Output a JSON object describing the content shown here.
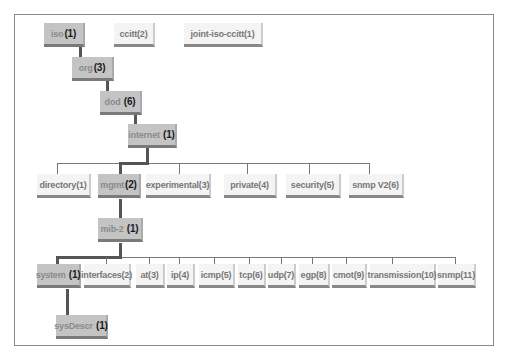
{
  "diagram": {
    "roots": [
      {
        "id": "iso",
        "name": "iso",
        "num": "(1)",
        "highlight": true
      },
      {
        "id": "ccitt",
        "name": "ccitt(2)",
        "num": "",
        "highlight": false
      },
      {
        "id": "joint",
        "name": "joint-iso-ccitt(1)",
        "num": "",
        "highlight": false
      }
    ],
    "path": [
      {
        "id": "org",
        "name": "org",
        "num": "(3)"
      },
      {
        "id": "dod",
        "name": "dod ",
        "num": "(6)"
      },
      {
        "id": "internet",
        "name": "internet ",
        "num": "(1)"
      }
    ],
    "internet_children": [
      {
        "id": "directory",
        "name": "directory(1)",
        "highlight": false
      },
      {
        "id": "mgmt",
        "name": "mgmt",
        "num": "(2)",
        "highlight": true
      },
      {
        "id": "experimental",
        "name": "experimental(3)",
        "highlight": false
      },
      {
        "id": "private",
        "name": "private(4)",
        "highlight": false
      },
      {
        "id": "security",
        "name": "security(5)",
        "highlight": false
      },
      {
        "id": "snmpv2",
        "name": "snmp V2(6)",
        "highlight": false
      }
    ],
    "mib2": {
      "name": "mib-2 ",
      "num": "(1)"
    },
    "mib2_children": [
      {
        "id": "system",
        "name": "system ",
        "num": "(1)",
        "highlight": true
      },
      {
        "id": "interfaces",
        "name": "interfaces(2)"
      },
      {
        "id": "at",
        "name": "at(3)"
      },
      {
        "id": "ip",
        "name": "ip(4)"
      },
      {
        "id": "icmp",
        "name": "icmp(5)"
      },
      {
        "id": "tcp",
        "name": "tcp(6)"
      },
      {
        "id": "udp",
        "name": "udp(7)"
      },
      {
        "id": "egp",
        "name": "egp(8)"
      },
      {
        "id": "cmot",
        "name": "cmot(9)"
      },
      {
        "id": "transmission",
        "name": "transmission(10)"
      },
      {
        "id": "snmp",
        "name": "snmp(11)"
      }
    ],
    "sysdescr": {
      "name": "sysDescr ",
      "num": "(1)"
    },
    "colors": {
      "highlight_box": "#c4c4c4",
      "plain_box": "#f4f4f4",
      "path_line": "#555555",
      "frame": "#8a8a8a"
    }
  }
}
